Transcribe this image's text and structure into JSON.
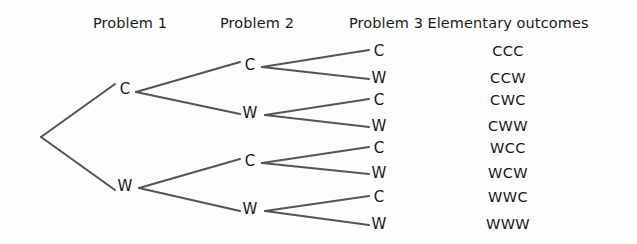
{
  "figure": {
    "background_color": "#fdfdfd",
    "edge_color": "#555555",
    "text_color": "#171717"
  },
  "headers": [
    {
      "label": "Problem 1",
      "x": 130,
      "y": 15
    },
    {
      "label": "Problem 2",
      "x": 257,
      "y": 15
    },
    {
      "label": "Problem 3",
      "x": 386,
      "y": 15
    },
    {
      "label": "Elementary outcomes",
      "x": 508,
      "y": 15
    }
  ],
  "nodes": [
    {
      "name": "root",
      "label": "",
      "x": 41,
      "y": 137,
      "level": 0
    },
    {
      "name": "level1-c",
      "label": "C",
      "x": 125,
      "y": 89,
      "level": 1
    },
    {
      "name": "level1-w",
      "label": "W",
      "x": 125,
      "y": 186,
      "level": 1
    },
    {
      "name": "level2-c-c",
      "label": "C",
      "x": 250,
      "y": 65,
      "level": 2
    },
    {
      "name": "level2-c-w",
      "label": "W",
      "x": 250,
      "y": 113,
      "level": 2
    },
    {
      "name": "level2-w-c",
      "label": "C",
      "x": 250,
      "y": 161,
      "level": 2
    },
    {
      "name": "level2-w-w",
      "label": "W",
      "x": 250,
      "y": 209,
      "level": 2
    },
    {
      "name": "level3-ccc",
      "label": "C",
      "x": 379,
      "y": 51,
      "level": 3
    },
    {
      "name": "level3-ccw",
      "label": "W",
      "x": 379,
      "y": 78,
      "level": 3
    },
    {
      "name": "level3-cwc",
      "label": "C",
      "x": 379,
      "y": 100,
      "level": 3
    },
    {
      "name": "level3-cww",
      "label": "W",
      "x": 379,
      "y": 126,
      "level": 3
    },
    {
      "name": "level3-wcc",
      "label": "C",
      "x": 379,
      "y": 148,
      "level": 3
    },
    {
      "name": "level3-wcw",
      "label": "W",
      "x": 379,
      "y": 173,
      "level": 3
    },
    {
      "name": "level3-wwc",
      "label": "C",
      "x": 379,
      "y": 197,
      "level": 3
    },
    {
      "name": "level3-www",
      "label": "W",
      "x": 379,
      "y": 224,
      "level": 3
    }
  ],
  "edges": [
    {
      "from": "root",
      "to": "level1-c",
      "x1": 41,
      "y1": 137,
      "x2": 115,
      "y2": 84
    },
    {
      "from": "root",
      "to": "level1-w",
      "x1": 41,
      "y1": 137,
      "x2": 115,
      "y2": 190
    },
    {
      "from": "level1-c",
      "to": "level2-c-c",
      "x1": 136,
      "y1": 92,
      "x2": 240,
      "y2": 62
    },
    {
      "from": "level1-c",
      "to": "level2-c-w",
      "x1": 136,
      "y1": 92,
      "x2": 240,
      "y2": 114
    },
    {
      "from": "level1-w",
      "to": "level2-w-c",
      "x1": 139,
      "y1": 188,
      "x2": 240,
      "y2": 159
    },
    {
      "from": "level1-w",
      "to": "level2-w-w",
      "x1": 139,
      "y1": 188,
      "x2": 240,
      "y2": 211
    },
    {
      "from": "level2-c-c",
      "to": "level3-ccc",
      "x1": 262,
      "y1": 67,
      "x2": 369,
      "y2": 50
    },
    {
      "from": "level2-c-c",
      "to": "level3-ccw",
      "x1": 262,
      "y1": 67,
      "x2": 369,
      "y2": 79
    },
    {
      "from": "level2-c-w",
      "to": "level3-cwc",
      "x1": 265,
      "y1": 115,
      "x2": 369,
      "y2": 99
    },
    {
      "from": "level2-c-w",
      "to": "level3-cww",
      "x1": 265,
      "y1": 115,
      "x2": 369,
      "y2": 127
    },
    {
      "from": "level2-w-c",
      "to": "level3-wcc",
      "x1": 262,
      "y1": 163,
      "x2": 369,
      "y2": 147
    },
    {
      "from": "level2-w-c",
      "to": "level3-wcw",
      "x1": 262,
      "y1": 163,
      "x2": 369,
      "y2": 174
    },
    {
      "from": "level2-w-w",
      "to": "level3-wwc",
      "x1": 265,
      "y1": 211,
      "x2": 369,
      "y2": 196
    },
    {
      "from": "level2-w-w",
      "to": "level3-www",
      "x1": 265,
      "y1": 211,
      "x2": 369,
      "y2": 225
    }
  ],
  "outcomes": [
    {
      "label": "CCC",
      "x": 508,
      "y": 51
    },
    {
      "label": "CCW",
      "x": 508,
      "y": 78
    },
    {
      "label": "CWC",
      "x": 508,
      "y": 100
    },
    {
      "label": "CWW",
      "x": 508,
      "y": 126
    },
    {
      "label": "WCC",
      "x": 508,
      "y": 148
    },
    {
      "label": "WCW",
      "x": 508,
      "y": 173
    },
    {
      "label": "WWC",
      "x": 508,
      "y": 197
    },
    {
      "label": "WWW",
      "x": 508,
      "y": 224
    }
  ],
  "chart_data": {
    "type": "diagram",
    "diagram_type": "probability-tree",
    "title": "",
    "stages": [
      "Problem 1",
      "Problem 2",
      "Problem 3"
    ],
    "branch_labels": [
      "C",
      "W"
    ],
    "branch_meaning": {
      "C": "Correct",
      "W": "Wrong"
    },
    "depth": 3,
    "leaf_count": 8,
    "elementary_outcomes": [
      "CCC",
      "CCW",
      "CWC",
      "CWW",
      "WCC",
      "WCW",
      "WWC",
      "WWW"
    ],
    "outcomes_column_header": "Elementary outcomes"
  }
}
